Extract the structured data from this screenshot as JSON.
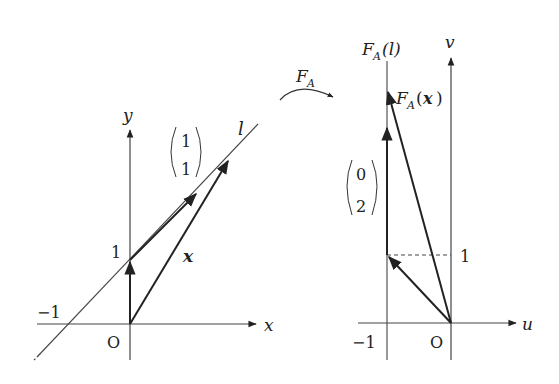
{
  "left_panel": {
    "x_axis_label": "x",
    "y_axis_label": "y",
    "origin_label": "O",
    "tick_y_1": "1",
    "tick_x_neg1": "−1",
    "line_label": "l",
    "direction_vector": {
      "top": "1",
      "bottom": "1"
    },
    "vector_label": "x"
  },
  "transform_arrow": {
    "label_main": "F",
    "label_sub": "A"
  },
  "right_panel": {
    "u_axis_label": "u",
    "v_axis_label": "v",
    "origin_label": "O",
    "tick_u_neg1": "−1",
    "tick_v_1": "1",
    "image_line_label": {
      "main": "F",
      "sub": "A",
      "arg": "(l)"
    },
    "image_vector_label": {
      "main": "F",
      "sub": "A",
      "open": "(",
      "arg": "x",
      "close": ")"
    },
    "direction_vector": {
      "top": "0",
      "bottom": "2"
    }
  },
  "colors": {
    "ink": "#222222",
    "thin_line": "#444444",
    "background": "#ffffff"
  }
}
